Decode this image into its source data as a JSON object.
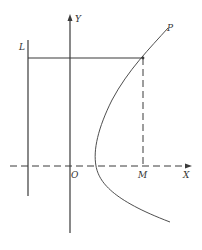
{
  "diagram": {
    "type": "geometry",
    "labels": {
      "y_axis": "Y",
      "x_axis": "X",
      "origin": "O",
      "directrix": "L",
      "curve_point": "P",
      "foot": "M"
    },
    "colors": {
      "line": "#3a3a3a",
      "text": "#333333",
      "background": "#ffffff"
    }
  }
}
